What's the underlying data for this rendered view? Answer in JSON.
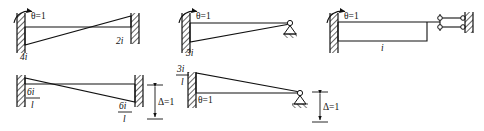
{
  "figure": {
    "ink_color": "#111111",
    "background_color": "#ffffff",
    "panels": [
      {
        "id": "panel-1",
        "description": "Fixed-fixed beam with unit rotation at left end",
        "left_support": "fixed-wall",
        "right_support": "fixed-wall",
        "cause_label": "θ=1",
        "near_end_label": "4i",
        "far_end_label": "2i"
      },
      {
        "id": "panel-2",
        "description": "Fixed-pinned beam with unit rotation at left end",
        "left_support": "fixed-wall",
        "right_support": "pin-on-ground",
        "cause_label": "θ=1",
        "near_end_label": "3i",
        "far_end_label": ""
      },
      {
        "id": "panel-3",
        "description": "Fixed-guided beam with unit rotation at left end",
        "left_support": "fixed-wall",
        "right_support": "double-link-guided",
        "cause_label": "θ=1",
        "near_end_label": "i",
        "far_end_label": ""
      },
      {
        "id": "panel-4",
        "description": "Fixed-fixed beam with unit relative end displacement",
        "left_support": "fixed-wall",
        "right_support": "fixed-wall",
        "cause_label": "Δ=1",
        "near_end_numerator": "6i",
        "near_end_denominator": "l",
        "far_end_numerator": "6i",
        "far_end_denominator": "l"
      },
      {
        "id": "panel-5",
        "description": "Fixed-pinned beam with unit relative end displacement",
        "left_support": "fixed-wall",
        "right_support": "pin-on-ground",
        "cause_label": "Δ=1",
        "rotation_label": "θ=1",
        "near_end_numerator": "3i",
        "near_end_denominator": "l"
      }
    ]
  }
}
